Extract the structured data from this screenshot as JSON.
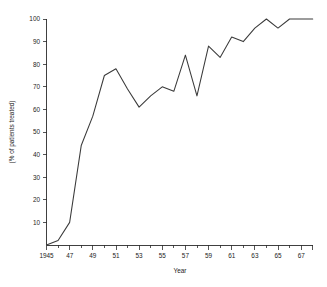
{
  "chart_data": {
    "type": "line",
    "title": "",
    "xlabel": "Year",
    "ylabel": "(% of patients treated)",
    "xlim": [
      1945,
      1968
    ],
    "ylim": [
      0,
      100
    ],
    "grid": false,
    "legend": "none",
    "x_tick_labels": [
      "1945",
      "47",
      "49",
      "51",
      "53",
      "55",
      "57",
      "59",
      "61",
      "63",
      "65",
      "67"
    ],
    "x_tick_values": [
      1945,
      1947,
      1949,
      1951,
      1953,
      1955,
      1957,
      1959,
      1961,
      1963,
      1965,
      1967
    ],
    "x_minor_tick_values": [
      1946,
      1948,
      1950,
      1952,
      1954,
      1956,
      1958,
      1960,
      1962,
      1964,
      1966,
      1968
    ],
    "y_tick_labels": [
      "10",
      "20",
      "30",
      "40",
      "50",
      "60",
      "70",
      "80",
      "90",
      "100"
    ],
    "y_tick_values": [
      10,
      20,
      30,
      40,
      50,
      60,
      70,
      80,
      90,
      100
    ],
    "series": [
      {
        "name": "Percent of patients treated",
        "x": [
          1945,
          1946,
          1947,
          1948,
          1949,
          1950,
          1951,
          1952,
          1953,
          1954,
          1955,
          1956,
          1957,
          1958,
          1959,
          1960,
          1961,
          1962,
          1963,
          1964,
          1965,
          1966,
          1967,
          1968
        ],
        "values": [
          0,
          2,
          10,
          44,
          57,
          75,
          78,
          69,
          61,
          66,
          70,
          68,
          84,
          66,
          88,
          83,
          92,
          90,
          96,
          100,
          96,
          100,
          100,
          100
        ]
      }
    ]
  }
}
